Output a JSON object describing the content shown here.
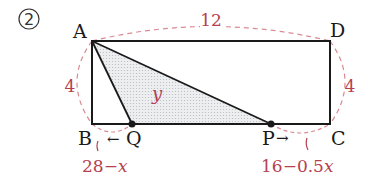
{
  "problem_number": "2",
  "vertices": {
    "A": {
      "label": "A",
      "x": 92,
      "y": 41
    },
    "D": {
      "label": "D",
      "x": 330,
      "y": 41
    },
    "B": {
      "label": "B",
      "x": 92,
      "y": 124
    },
    "C": {
      "label": "C",
      "x": 330,
      "y": 124
    },
    "Q": {
      "label": "Q",
      "x": 132,
      "y": 124
    },
    "P": {
      "label": "P",
      "x": 271,
      "y": 124
    }
  },
  "dimensions": {
    "top": "12",
    "left": "4",
    "right": "4"
  },
  "area_label": "y",
  "segment_labels": {
    "BQ": "28−",
    "BQ_var": "x",
    "PC": "16−0.5",
    "PC_var": "x"
  },
  "arrows": {
    "Q_arrow": "←",
    "P_arrow": "→"
  },
  "colors": {
    "line": "#1a1a1a",
    "annotation": "#b5404f",
    "dashed": "#d98a93",
    "fill": "#e6e8ea"
  }
}
